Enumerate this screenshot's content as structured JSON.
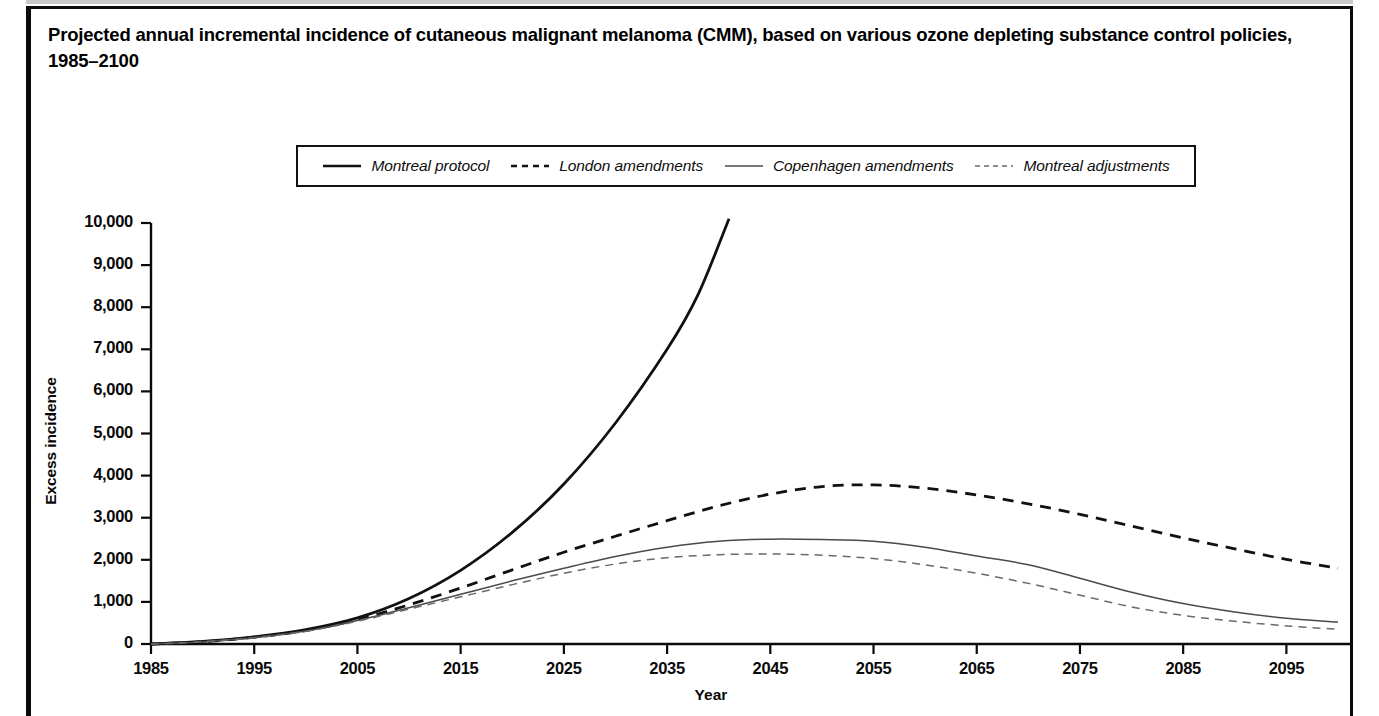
{
  "title": "Projected annual incremental incidence of cutaneous malignant melanoma (CMM), based on various ozone depleting substance control policies, 1985–2100",
  "axis": {
    "ylabel": "Excess incidence",
    "xlabel": "Year"
  },
  "legend": {
    "entries": [
      {
        "label": "Montreal protocol",
        "style": "solid",
        "weight": "thick",
        "color": "#111111"
      },
      {
        "label": "London amendments",
        "style": "dashed",
        "weight": "thick",
        "color": "#111111"
      },
      {
        "label": "Copenhagen amendments",
        "style": "solid",
        "weight": "thin",
        "color": "#4a4a4a"
      },
      {
        "label": "Montreal adjustments",
        "style": "dashed",
        "weight": "thin",
        "color": "#6a6a6a"
      }
    ]
  },
  "chart_data": {
    "type": "line",
    "title": "Projected annual incremental incidence of cutaneous malignant melanoma (CMM), based on various ozone depleting substance control policies, 1985–2100",
    "xlabel": "Year",
    "ylabel": "Excess incidence",
    "xlim": [
      1985,
      2100
    ],
    "ylim": [
      0,
      10000
    ],
    "grid": false,
    "legend_position": "top-center",
    "xticks": [
      1985,
      1995,
      2005,
      2015,
      2025,
      2035,
      2045,
      2055,
      2065,
      2075,
      2085,
      2095
    ],
    "xtick_labels": [
      "1985",
      "1995",
      "2005",
      "2015",
      "2025",
      "2035",
      "2045",
      "2055",
      "2065",
      "2075",
      "2085",
      "2095"
    ],
    "yticks": [
      0,
      1000,
      2000,
      3000,
      4000,
      5000,
      6000,
      7000,
      8000,
      9000,
      10000
    ],
    "ytick_labels": [
      "0",
      "1,000",
      "2,000",
      "3,000",
      "4,000",
      "5,000",
      "6,000",
      "7,000",
      "8,000",
      "9,000",
      "10,000"
    ],
    "series": [
      {
        "name": "Montreal protocol",
        "style": "solid",
        "weight": "thick",
        "color": "#111111",
        "x": [
          1985,
          1990,
          1995,
          2000,
          2005,
          2010,
          2015,
          2020,
          2025,
          2030,
          2035,
          2038,
          2041
        ],
        "values": [
          0,
          60,
          170,
          340,
          620,
          1080,
          1750,
          2650,
          3800,
          5250,
          7000,
          8300,
          10100
        ]
      },
      {
        "name": "London amendments",
        "style": "dashed",
        "weight": "thick",
        "color": "#111111",
        "x": [
          1985,
          1990,
          1995,
          2000,
          2005,
          2010,
          2015,
          2020,
          2025,
          2030,
          2035,
          2040,
          2045,
          2050,
          2055,
          2060,
          2065,
          2070,
          2075,
          2080,
          2085,
          2090,
          2095,
          2100
        ],
        "values": [
          0,
          55,
          160,
          320,
          580,
          930,
          1330,
          1760,
          2180,
          2560,
          2930,
          3280,
          3560,
          3740,
          3780,
          3700,
          3540,
          3330,
          3080,
          2800,
          2520,
          2260,
          2010,
          1800
        ]
      },
      {
        "name": "Copenhagen amendments",
        "style": "solid",
        "weight": "thin",
        "color": "#4a4a4a",
        "x": [
          1985,
          1990,
          1995,
          2000,
          2005,
          2010,
          2015,
          2020,
          2025,
          2030,
          2035,
          2040,
          2045,
          2050,
          2055,
          2060,
          2065,
          2070,
          2075,
          2080,
          2085,
          2090,
          2095,
          2100
        ],
        "values": [
          0,
          55,
          155,
          310,
          560,
          860,
          1180,
          1500,
          1800,
          2080,
          2300,
          2440,
          2490,
          2480,
          2440,
          2300,
          2090,
          1880,
          1560,
          1230,
          960,
          760,
          610,
          520
        ]
      },
      {
        "name": "Montreal adjustments",
        "style": "dashed",
        "weight": "thin",
        "color": "#6a6a6a",
        "x": [
          1985,
          1990,
          1995,
          2000,
          2005,
          2010,
          2015,
          2020,
          2025,
          2030,
          2035,
          2040,
          2045,
          2050,
          2055,
          2060,
          2065,
          2070,
          2075,
          2080,
          2085,
          2090,
          2095,
          2100
        ],
        "values": [
          0,
          52,
          150,
          300,
          540,
          830,
          1120,
          1410,
          1680,
          1900,
          2050,
          2120,
          2140,
          2110,
          2030,
          1880,
          1680,
          1440,
          1160,
          880,
          680,
          540,
          430,
          350
        ]
      }
    ]
  }
}
